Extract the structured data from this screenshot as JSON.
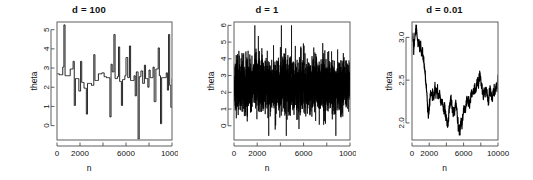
{
  "figure": {
    "background": "#ffffff",
    "line_color": "#000000",
    "axis_color": "#4d4d4d",
    "panel_count": 3
  },
  "chart_data": [
    {
      "type": "line",
      "title": "d = 100",
      "xlabel": "n",
      "ylabel": "theta",
      "xlim": [
        0,
        10000
      ],
      "ylim": [
        -0.75,
        5.4
      ],
      "xticks": [
        0,
        2000,
        6000,
        10000
      ],
      "xtick_labels": [
        "0",
        "2000",
        "6000",
        "10000"
      ],
      "xminor": [
        4000,
        8000
      ],
      "yticks": [
        0,
        1,
        2,
        3,
        4,
        5
      ],
      "ytick_labels": [
        "0",
        "1",
        "2",
        "3",
        "4",
        "5"
      ],
      "grid": false,
      "legend": "none",
      "description": "MCMC trace, large proposal scale: low acceptance, long flat runs with occasional large jumps",
      "series": [
        {
          "name": "theta",
          "x": [
            0,
            50,
            100,
            150,
            200,
            250,
            300,
            350,
            400,
            450,
            500,
            550,
            600,
            650,
            700,
            750,
            800,
            850,
            900,
            950,
            1000,
            1050,
            1100,
            1150,
            1200,
            1250,
            1300,
            1350,
            1400,
            1450,
            1500,
            1550,
            1600,
            1650,
            1700,
            1750,
            1800,
            1850,
            1900,
            1950,
            2000,
            2050,
            2100,
            2150,
            2200,
            2250,
            2300,
            2350,
            2400,
            2450,
            2500,
            2550,
            2600,
            2650,
            2700,
            2750,
            2800,
            2850,
            2900,
            2950,
            3000,
            3050,
            3100,
            3150,
            3200,
            3250,
            3300,
            3350,
            3400,
            3450,
            3500,
            3550,
            3600,
            3650,
            3700,
            3750,
            3800,
            3850,
            3900,
            3950,
            4000,
            4050,
            4100,
            4150,
            4200,
            4250,
            4300,
            4350,
            4400,
            4450,
            4500,
            4550,
            4600,
            4650,
            4700,
            4750,
            4800,
            4850,
            4900,
            4950,
            5000,
            5050,
            5100,
            5150,
            5200,
            5250,
            5300,
            5350,
            5400,
            5450,
            5500,
            5550,
            5600,
            5650,
            5700,
            5750,
            5800,
            5850,
            5900,
            5950,
            6000,
            6050,
            6100,
            6150,
            6200,
            6250,
            6300,
            6350,
            6400,
            6450,
            6500,
            6550,
            6600,
            6650,
            6700,
            6750,
            6800,
            6850,
            6900,
            6950,
            7000,
            7050,
            7100,
            7150,
            7200,
            7250,
            7300,
            7350,
            7400,
            7450,
            7500,
            7550,
            7600,
            7650,
            7700,
            7750,
            7800,
            7850,
            7900,
            7950,
            8000,
            8050,
            8100,
            8150,
            8200,
            8250,
            8300,
            8350,
            8400,
            8450,
            8500,
            8550,
            8600,
            8650,
            8700,
            8750,
            8800,
            8850,
            8900,
            8950,
            9000,
            9050,
            9100,
            9150,
            9200,
            9250,
            9300,
            9350,
            9400,
            9450,
            9500,
            9550,
            9600,
            9650,
            9700,
            9750,
            9800,
            9850,
            9900,
            9950,
            10000
          ],
          "y": [
            2.7,
            2.7,
            2.7,
            2.7,
            2.65,
            2.65,
            2.65,
            2.65,
            2.65,
            2.65,
            3.05,
            3.05,
            5.25,
            5.25,
            2.6,
            2.6,
            2.6,
            2.6,
            2.6,
            2.6,
            2.6,
            2.6,
            2.6,
            2.95,
            2.95,
            2.95,
            2.95,
            2.95,
            3.35,
            3.35,
            1.05,
            1.05,
            2.45,
            2.45,
            2.45,
            2.45,
            2.45,
            2.45,
            1.8,
            1.8,
            1.8,
            3.35,
            3.35,
            2.25,
            2.25,
            2.25,
            2.25,
            1.95,
            1.95,
            1.95,
            1.95,
            0.6,
            0.6,
            2.2,
            2.2,
            2.2,
            2.2,
            2.2,
            2.2,
            2.2,
            2.1,
            2.1,
            2.1,
            2.1,
            3.7,
            3.7,
            2.35,
            2.35,
            2.35,
            2.35,
            2.35,
            2.35,
            2.7,
            2.7,
            2.7,
            2.7,
            2.7,
            2.7,
            2.75,
            2.75,
            2.75,
            2.75,
            2.55,
            2.55,
            2.55,
            2.55,
            2.5,
            2.5,
            2.5,
            2.5,
            2.5,
            2.5,
            0.45,
            0.45,
            3.2,
            3.2,
            2.8,
            2.8,
            2.8,
            4.75,
            4.75,
            2.45,
            2.45,
            2.45,
            2.45,
            2.55,
            2.55,
            4.1,
            4.1,
            2.3,
            2.3,
            2.3,
            1.05,
            1.05,
            2.4,
            2.4,
            2.4,
            2.4,
            2.6,
            2.6,
            3.55,
            3.55,
            3.55,
            2.5,
            2.5,
            2.5,
            4.15,
            4.15,
            2.35,
            2.35,
            2.35,
            2.35,
            2.35,
            2.35,
            2.6,
            2.6,
            1.55,
            1.55,
            2.8,
            2.8,
            2.8,
            -0.7,
            -0.7,
            2.55,
            2.55,
            2.55,
            2.85,
            2.85,
            2.85,
            2.2,
            2.2,
            2.2,
            3.15,
            3.15,
            2.45,
            2.45,
            2.45,
            2.45,
            2.0,
            2.0,
            2.9,
            2.9,
            2.5,
            2.5,
            2.5,
            2.5,
            2.5,
            3.05,
            3.05,
            1.25,
            1.25,
            1.25,
            2.95,
            2.95,
            2.95,
            2.95,
            4.05,
            4.05,
            2.6,
            2.6,
            0.1,
            0.1,
            2.5,
            2.5,
            2.5,
            2.5,
            2.5,
            2.5,
            2.5,
            2.5,
            2.75,
            2.75,
            1.85,
            1.85,
            4.75,
            4.75,
            2.1,
            2.1,
            0.95,
            0.95,
            2.45,
            2.45,
            2.4,
            2.4,
            2.4,
            2.4
          ]
        }
      ]
    },
    {
      "type": "line",
      "title": "d = 1",
      "xlabel": "n",
      "ylabel": "theta",
      "xlim": [
        0,
        10000
      ],
      "ylim": [
        -0.85,
        6.2
      ],
      "xticks": [
        0,
        2000,
        6000,
        10000
      ],
      "xtick_labels": [
        "0",
        "2000",
        "6000",
        "10000"
      ],
      "xminor": [
        4000,
        8000
      ],
      "yticks": [
        0,
        1,
        2,
        3,
        4,
        5,
        6
      ],
      "ytick_labels": [
        "0",
        "1",
        "2",
        "3",
        "4",
        "5",
        "6"
      ],
      "grid": false,
      "legend": "none",
      "description": "MCMC trace, well-tuned proposal scale: dense rapidly mixing noise band centred near 2.4, spanning roughly -0.5 to 6",
      "series": [
        {
          "name": "theta",
          "center": 2.4,
          "band_low": 0.6,
          "band_high": 4.1,
          "spike_low": -0.6,
          "spike_high": 6.0,
          "n_points": 10000
        }
      ]
    },
    {
      "type": "line",
      "title": "d = 0.01",
      "xlabel": "n",
      "ylabel": "theta",
      "xlim": [
        0,
        10000
      ],
      "ylim": [
        1.8,
        3.18
      ],
      "xticks": [
        0,
        2000,
        6000,
        10000
      ],
      "xtick_labels": [
        "0",
        "2000",
        "6000",
        "10000"
      ],
      "xminor": [
        4000,
        8000
      ],
      "yticks": [
        2.0,
        2.5,
        3.0
      ],
      "ytick_labels": [
        "2.0",
        "2.5",
        "3.0"
      ],
      "grid": false,
      "legend": "none",
      "description": "MCMC trace, tiny proposal scale: highly autocorrelated slow random walk drifting from 3.0 down to 1.85 then back up to 2.5",
      "series": [
        {
          "name": "theta",
          "x": [
            0,
            100,
            200,
            300,
            400,
            500,
            600,
            700,
            800,
            900,
            1000,
            1100,
            1200,
            1300,
            1400,
            1500,
            1600,
            1700,
            1800,
            1900,
            2000,
            2100,
            2200,
            2300,
            2400,
            2500,
            2600,
            2700,
            2800,
            2900,
            3000,
            3100,
            3200,
            3300,
            3400,
            3500,
            3600,
            3700,
            3800,
            3900,
            4000,
            4100,
            4200,
            4300,
            4400,
            4500,
            4600,
            4700,
            4800,
            4900,
            5000,
            5100,
            5200,
            5300,
            5400,
            5500,
            5600,
            5700,
            5800,
            5900,
            6000,
            6100,
            6200,
            6300,
            6400,
            6500,
            6600,
            6700,
            6800,
            6900,
            7000,
            7100,
            7200,
            7300,
            7400,
            7500,
            7600,
            7700,
            7800,
            7900,
            8000,
            8100,
            8200,
            8300,
            8400,
            8500,
            8600,
            8700,
            8800,
            8900,
            9000,
            9100,
            9200,
            9300,
            9400,
            9500,
            9600,
            9700,
            9800,
            9900,
            10000
          ],
          "y": [
            2.96,
            3.02,
            2.88,
            2.94,
            3.06,
            3.14,
            3.02,
            2.9,
            2.97,
            2.86,
            2.92,
            2.8,
            2.86,
            2.76,
            2.7,
            2.62,
            2.5,
            2.38,
            2.2,
            2.1,
            2.18,
            2.3,
            2.38,
            2.3,
            2.36,
            2.28,
            2.36,
            2.42,
            2.34,
            2.4,
            2.32,
            2.3,
            2.35,
            2.28,
            2.22,
            2.26,
            2.2,
            2.14,
            2.18,
            2.1,
            2.04,
            1.96,
            2.02,
            2.12,
            2.2,
            2.3,
            2.22,
            2.16,
            2.1,
            2.14,
            2.2,
            2.26,
            2.16,
            2.06,
            1.96,
            1.88,
            1.94,
            2.04,
            1.98,
            2.06,
            2.14,
            2.2,
            2.12,
            2.22,
            2.3,
            2.24,
            2.3,
            2.22,
            2.28,
            2.36,
            2.3,
            2.38,
            2.34,
            2.42,
            2.36,
            2.44,
            2.5,
            2.44,
            2.52,
            2.56,
            2.5,
            2.42,
            2.36,
            2.3,
            2.38,
            2.34,
            2.42,
            2.36,
            2.3,
            2.26,
            2.34,
            2.4,
            2.34,
            2.26,
            2.32,
            2.4,
            2.34,
            2.4,
            2.46,
            2.4,
            2.56
          ]
        }
      ]
    }
  ]
}
